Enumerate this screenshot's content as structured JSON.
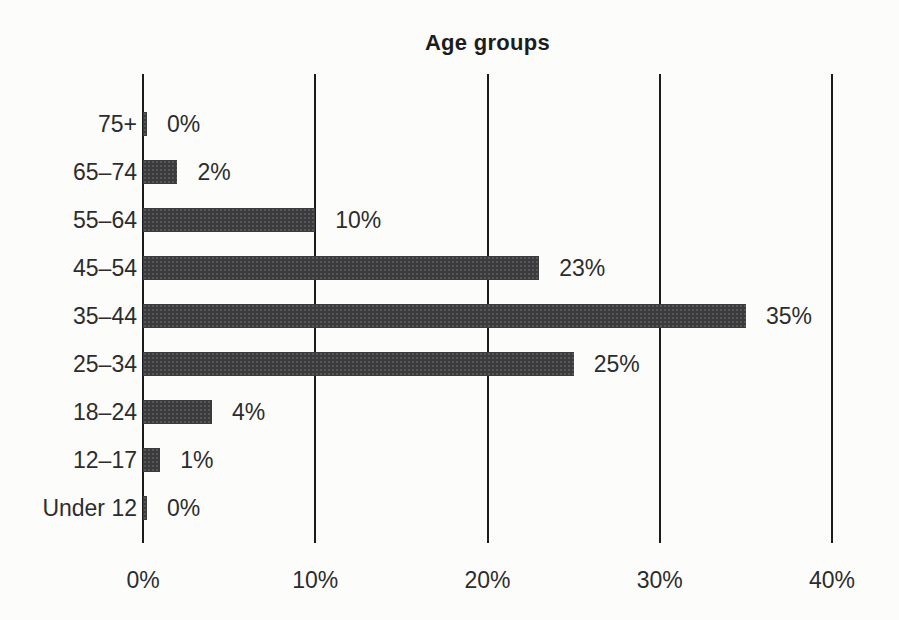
{
  "chart_data": {
    "type": "bar",
    "orientation": "horizontal",
    "title": "Age groups",
    "categories": [
      "75+",
      "65–74",
      "55–64",
      "45–54",
      "35–44",
      "25–34",
      "18–24",
      "12–17",
      "Under 12"
    ],
    "values": [
      0,
      2,
      10,
      23,
      35,
      25,
      4,
      1,
      0
    ],
    "value_labels": [
      "0%",
      "2%",
      "10%",
      "23%",
      "35%",
      "25%",
      "4%",
      "1%",
      "0%"
    ],
    "xlabel": "",
    "ylabel": "",
    "xlim": [
      0,
      40
    ],
    "x_ticks": [
      0,
      10,
      20,
      30,
      40
    ],
    "x_tick_labels": [
      "0%",
      "10%",
      "20%",
      "30%",
      "40%"
    ],
    "grid": "vertical-lines",
    "legend": "none",
    "colors": {
      "bar": "#3b3b3e",
      "gridline": "#1b1b1c",
      "text": "#2c2c2e",
      "background": "#fcfcfb"
    }
  }
}
